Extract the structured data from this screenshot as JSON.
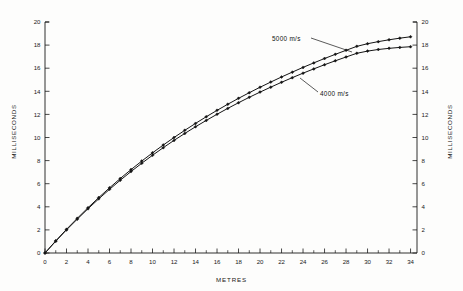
{
  "chart_data": {
    "type": "line",
    "title": "",
    "subtitle": "",
    "xlabel": "METRES",
    "ylabel": "MILLISECONDS",
    "y2label": "MILLISECONDS",
    "xlim": [
      0,
      34.6
    ],
    "ylim": [
      0,
      20
    ],
    "grid": false,
    "legend_position": "inline-annotations",
    "x_major_ticks": [
      0,
      2,
      4,
      6,
      8,
      10,
      12,
      14,
      16,
      18,
      20,
      22,
      24,
      26,
      28,
      30,
      32,
      34
    ],
    "x_minor_ticks": [
      1,
      3,
      5,
      7,
      9,
      11,
      13,
      15,
      17,
      19,
      21,
      23,
      25,
      27,
      29,
      31,
      33
    ],
    "x_tick_labels": [
      "0",
      "2",
      "4",
      "6",
      "8",
      "10",
      "12",
      "14",
      "16",
      "18",
      "20",
      "22",
      "24",
      "26",
      "28",
      "30",
      "32",
      "34"
    ],
    "y_major_ticks": [
      0,
      2,
      4,
      6,
      8,
      10,
      12,
      14,
      16,
      18,
      20
    ],
    "y_tick_labels": [
      "0",
      "2",
      "4",
      "6",
      "8",
      "10",
      "12",
      "14",
      "16",
      "18",
      "20"
    ],
    "y2_tick_labels": [
      "0",
      "2",
      "4",
      "6",
      "8",
      "10",
      "12",
      "14",
      "16",
      "18",
      "20"
    ],
    "marker": "diamond",
    "series": [
      {
        "name": "5000 m/s",
        "annotation": "5000 m/s",
        "color": "#141414",
        "x": [
          0,
          1,
          2,
          3,
          4,
          5,
          6,
          7,
          8,
          9,
          10,
          11,
          12,
          13,
          14,
          15,
          16,
          17,
          18,
          19,
          20,
          21,
          22,
          23,
          24,
          25,
          26,
          27,
          28,
          29,
          30,
          31,
          32,
          33,
          34
        ],
        "y": [
          0.0,
          1.05,
          2.05,
          3.0,
          3.92,
          4.8,
          5.64,
          6.45,
          7.22,
          7.96,
          8.67,
          9.35,
          10.0,
          10.62,
          11.22,
          11.8,
          12.35,
          12.88,
          13.39,
          13.88,
          14.35,
          14.8,
          15.24,
          15.66,
          16.07,
          16.46,
          16.84,
          17.2,
          17.55,
          17.89,
          18.12,
          18.3,
          18.46,
          18.6,
          18.72
        ]
      },
      {
        "name": "4000 m/s",
        "annotation": "4000 m/s",
        "color": "#141414",
        "x": [
          0,
          1,
          2,
          3,
          4,
          5,
          6,
          7,
          8,
          9,
          10,
          11,
          12,
          13,
          14,
          15,
          16,
          17,
          18,
          19,
          20,
          21,
          22,
          23,
          24,
          25,
          26,
          27,
          28,
          29,
          30,
          31,
          32,
          33,
          34
        ],
        "y": [
          0.0,
          1.02,
          2.0,
          2.93,
          3.83,
          4.69,
          5.51,
          6.3,
          7.05,
          7.77,
          8.46,
          9.12,
          9.75,
          10.35,
          10.93,
          11.48,
          12.01,
          12.52,
          13.01,
          13.48,
          13.93,
          14.36,
          14.78,
          15.18,
          15.57,
          15.94,
          16.3,
          16.64,
          16.97,
          17.29,
          17.48,
          17.62,
          17.72,
          17.8,
          17.86
        ]
      }
    ],
    "annotations": [
      {
        "text": "5000 m/s",
        "target_series": "5000 m/s",
        "leader": true
      },
      {
        "text": "4000 m/s",
        "target_series": "4000 m/s",
        "leader": true
      }
    ]
  },
  "axes": {
    "x_title": "METRES",
    "y_left_title": "MILLISECONDS",
    "y_right_title": "MILLISECONDS"
  },
  "annotations": {
    "upper": "5000 m/s",
    "lower": "4000 m/s"
  },
  "colors": {
    "ink": "#141414",
    "axis": "#1a1a1a",
    "background": "#fdfdfc"
  }
}
